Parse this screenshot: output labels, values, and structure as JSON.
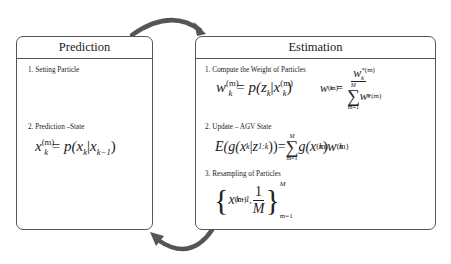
{
  "diagram": {
    "type": "particle-filter-cycle",
    "colors": {
      "border": "#555555",
      "arrow": "#555555",
      "text": "#222222",
      "background": "#ffffff"
    },
    "prediction": {
      "title": "Prediction",
      "steps": [
        {
          "label": "1. Setting Particle",
          "formula": ""
        },
        {
          "label": "2. Prediction –State",
          "formula": "x_k^(m) = p(x_k | x_{k-1})"
        }
      ],
      "eq2": {
        "lhs": "x",
        "lhs_sup": "(m)",
        "lhs_sub": "k",
        "eq": " = ",
        "p": "p(x",
        "sub_k": "k",
        "bar": "|",
        "x": "x",
        "sub_km1": "k−1",
        "close": ")"
      }
    },
    "estimation": {
      "title": "Estimation",
      "steps": [
        {
          "label": "1. Compute the Weight of Particles",
          "formula": "w_k^(m) = p(z_k | x_k^(m));  w_k^(m) = w_k^*(m) / sum_{m=1}^{M} w_k^*(m)"
        },
        {
          "label": "2. Update – AGV State",
          "formula": "E(g(x_k | z_1k)) = sum_{m=1}^{M} g(x_k^(m)) w_k^(m)"
        },
        {
          "label": "3. Resampling of Particles",
          "formula": "{ x_{k-1}^(m), 1/M }_{m=1}^{M}"
        }
      ],
      "eq1a": {
        "w": "w",
        "sup": "(m)",
        "sub": "k",
        "eq": " = ",
        "p": "p(z",
        "sub_k": "k",
        "bar": "|",
        "x": "x",
        "x_sup": "(m)",
        "x_sub": "k",
        "close": ")"
      },
      "eq1b": {
        "w": "w",
        "sup": "(m)",
        "sub": "k",
        "eq": " = ",
        "num_w": "w",
        "num_sup": "*(m)",
        "num_sub": "k",
        "sum_top": "M",
        "sum_sym": "∑",
        "sum_bot": "m=1",
        "den_w": "w",
        "den_sup": "*(m)",
        "den_sub": "k"
      },
      "eq2": {
        "E": "E(g(x",
        "sub_k": "k",
        "bar": "|",
        "z": "z",
        "sub_1k": "1:k",
        "close": "))",
        "eq": "=",
        "sum_top": "M",
        "sum_sym": "∑",
        "sum_bot": "m=1",
        "g": "g(x",
        "g_sup": "(m)",
        "g_sub": "k",
        "g_close": ")",
        "w": "w",
        "w_sup": "(m)",
        "w_sub": "k"
      },
      "eq3": {
        "lbrace": "{",
        "x": "x",
        "x_sup": "(m)",
        "x_sub": "k−1",
        "comma": " , ",
        "num": "1",
        "den": "M",
        "rbrace": "}",
        "upper": "M",
        "lower": "m=1"
      }
    },
    "arrows": [
      {
        "from": "prediction",
        "to": "estimation",
        "position": "top"
      },
      {
        "from": "estimation",
        "to": "prediction",
        "position": "bottom"
      }
    ]
  }
}
